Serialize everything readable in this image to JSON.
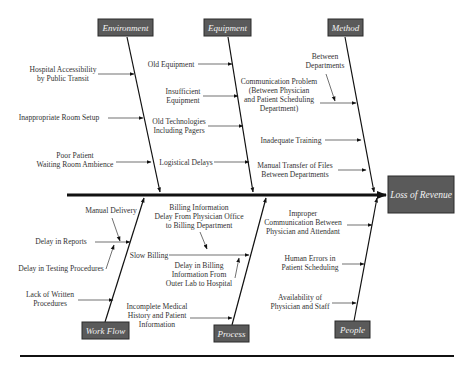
{
  "diagram": {
    "type": "fishbone",
    "effect": "Loss of Revenue",
    "colors": {
      "box_fill": "#5a5a5a",
      "box_stroke": "#2a2a2a",
      "line": "#111111",
      "text": "#333333",
      "box_text": "#f2f2f2"
    },
    "categories": {
      "environment": {
        "label": "Environment",
        "causes": [
          [
            "Hospital Accessibility",
            "by Public Transit"
          ],
          [
            "Inappropriate Room Setup"
          ],
          [
            "Poor Patient",
            "Waiting Room Ambience"
          ]
        ]
      },
      "equipment": {
        "label": "Equipment",
        "causes": [
          [
            "Old Equipment"
          ],
          [
            "Insufficient",
            "Equipment"
          ],
          [
            "Old Technologies",
            "Including Pagers"
          ],
          [
            "Logistical Delays"
          ]
        ]
      },
      "method": {
        "label": "Method",
        "causes": [
          [
            "Communication Problem",
            "(Between Physician",
            "and Patient Scheduling",
            "Department)"
          ],
          [
            "Inadequate Training"
          ],
          [
            "Manual Transfer of Files",
            "Between Departments"
          ]
        ],
        "subcauses": [
          [
            "Between",
            "Departments"
          ]
        ]
      },
      "workflow": {
        "label": "Work Flow",
        "causes": [
          [
            "Delay in Reports"
          ],
          [
            "Lack of Written",
            "Procedures"
          ]
        ],
        "subcauses": [
          [
            "Manual Delivery"
          ],
          [
            "Delay in Testing Procedures"
          ]
        ]
      },
      "process": {
        "label": "Process",
        "causes": [
          [
            "Slow Billing"
          ],
          [
            "Incomplete Medical",
            "History and Patient",
            "Information"
          ]
        ],
        "subcauses": [
          [
            "Billing Information",
            "Delay From Physician Office",
            "to Billing Department"
          ],
          [
            "Delay in Billing",
            "Information From",
            "Outer Lab to Hospital"
          ]
        ]
      },
      "people": {
        "label": "People",
        "causes": [
          [
            "Improper",
            "Communication Between",
            "Physician and Attendant"
          ],
          [
            "Human Errors in",
            "Patient Scheduling"
          ],
          [
            "Availability of",
            "Physician and Staff"
          ]
        ]
      }
    }
  }
}
